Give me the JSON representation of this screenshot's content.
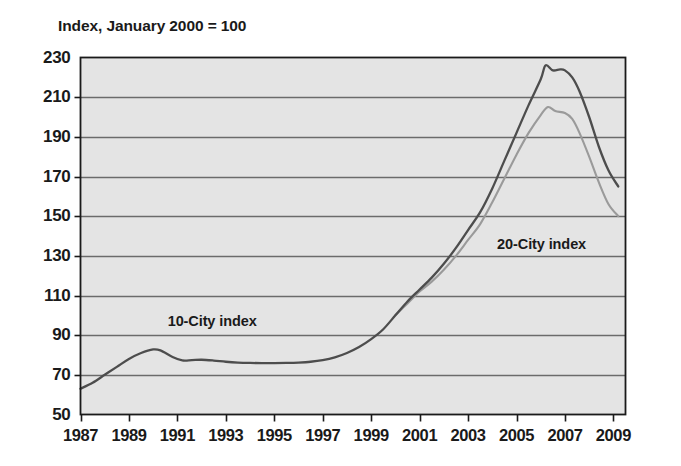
{
  "chart_data": {
    "type": "line",
    "title": "Index, January 2000 = 100",
    "xlabel": "",
    "ylabel": "",
    "xlim": [
      1987,
      2009.5
    ],
    "ylim": [
      50,
      230
    ],
    "yticks": [
      230,
      210,
      190,
      170,
      150,
      130,
      110,
      90,
      70,
      50
    ],
    "xticks": [
      1987,
      1989,
      1991,
      1993,
      1995,
      1997,
      1999,
      2001,
      2003,
      2005,
      2007,
      2009
    ],
    "grid": "horizontal",
    "legend_position": "inline-annotation",
    "plot_background": "#e4e4e4",
    "gridline_color": "#6b6b6b",
    "axis_color": "#1a1a1a",
    "annotations": [
      {
        "text": "10-City index",
        "x": 1990.6,
        "y": 101
      },
      {
        "text": "20-City index",
        "x": 2004.2,
        "y": 140
      }
    ],
    "series": [
      {
        "name": "10-City index",
        "color": "#4d4d4d",
        "x": [
          1987.0,
          1987.5,
          1988.0,
          1988.5,
          1989.0,
          1989.5,
          1990.0,
          1990.3,
          1990.8,
          1991.2,
          1991.6,
          1992.0,
          1992.5,
          1993.0,
          1993.5,
          1994.0,
          1994.5,
          1995.0,
          1995.5,
          1996.0,
          1996.5,
          1997.0,
          1997.5,
          1998.0,
          1998.5,
          1999.0,
          1999.5,
          2000.0,
          2000.5,
          2001.0,
          2001.5,
          2002.0,
          2002.5,
          2003.0,
          2003.5,
          2004.0,
          2004.5,
          2005.0,
          2005.5,
          2006.0,
          2006.2,
          2006.5,
          2006.8,
          2007.0,
          2007.3,
          2007.6,
          2008.0,
          2008.4,
          2008.8,
          2009.2
        ],
        "y": [
          63.0,
          66.0,
          70.0,
          74.0,
          78.0,
          81.0,
          82.8,
          82.3,
          79.0,
          77.3,
          77.4,
          77.6,
          77.2,
          76.6,
          76.2,
          76.0,
          75.9,
          75.9,
          76.0,
          76.2,
          76.6,
          77.4,
          78.8,
          81.0,
          84.0,
          88.0,
          93.0,
          100.0,
          107.0,
          113.0,
          119.0,
          126.0,
          134.0,
          143.0,
          152.0,
          164.0,
          178.0,
          192.0,
          206.0,
          219.0,
          226.0,
          223.5,
          224.0,
          223.5,
          220.0,
          213.0,
          200.0,
          185.0,
          173.0,
          165.0
        ]
      },
      {
        "name": "20-City index",
        "color": "#9a9a9a",
        "x": [
          2000.0,
          2000.5,
          2001.0,
          2001.5,
          2002.0,
          2002.5,
          2003.0,
          2003.5,
          2004.0,
          2004.5,
          2005.0,
          2005.5,
          2006.0,
          2006.3,
          2006.6,
          2007.0,
          2007.3,
          2007.6,
          2008.0,
          2008.4,
          2008.8,
          2009.2
        ],
        "y": [
          100.0,
          106.0,
          112.0,
          117.0,
          123.0,
          130.0,
          138.0,
          146.0,
          157.0,
          169.0,
          181.0,
          192.0,
          201.0,
          205.0,
          203.0,
          202.0,
          199.0,
          192.0,
          180.0,
          167.0,
          156.0,
          150.0
        ]
      }
    ]
  }
}
